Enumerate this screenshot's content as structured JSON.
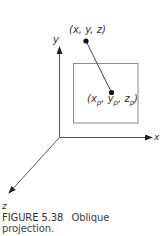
{
  "figure": {
    "caption_number": "FIGURE 5.38",
    "caption_title_line1": "Oblique",
    "caption_title_line2": "projection."
  },
  "axes": {
    "y_label": "y",
    "x_label": "x",
    "z_label": "z"
  },
  "points": {
    "source_label": "(x, y, z)",
    "projected_label_open": "(",
    "projected_x": "x",
    "projected_y": "y",
    "projected_z": "z",
    "subscript": "p",
    "sep": ", ",
    "projected_label_close": ")"
  },
  "colors": {
    "stroke": "#555555",
    "plane": "#8a8a8a",
    "point": "#111111",
    "text": "#333333"
  }
}
